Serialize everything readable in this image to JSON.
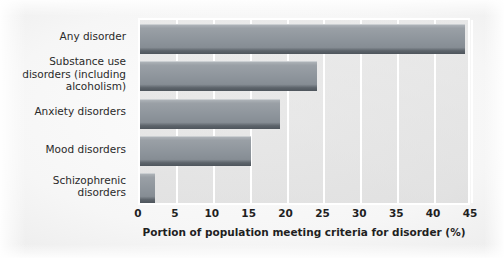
{
  "chart_data": {
    "type": "bar",
    "orientation": "horizontal",
    "title": "",
    "xlabel": "Portion of population meeting criteria for disorder (%)",
    "ylabel": "",
    "xlim": [
      0,
      45
    ],
    "ylim": null,
    "grid": true,
    "legend": null,
    "xticks": [
      "0",
      "5",
      "10",
      "15",
      "20",
      "25",
      "30",
      "35",
      "40",
      "45"
    ],
    "xtick_values": [
      0,
      5,
      10,
      15,
      20,
      25,
      30,
      35,
      40,
      45
    ],
    "categories": [
      "Any disorder",
      "Substance use disorders (including alcoholism)",
      "Anxiety disorders",
      "Mood disorders",
      "Schizophrenic disorders"
    ],
    "category_lines": [
      [
        "Any disorder"
      ],
      [
        "Substance use",
        "disorders (including",
        "alcoholism)"
      ],
      [
        "Anxiety disorders"
      ],
      [
        "Mood disorders"
      ],
      [
        "Schizophrenic",
        "disorders"
      ]
    ],
    "values": [
      44,
      24,
      19,
      15,
      2
    ],
    "bars": [
      {
        "label": "Any disorder",
        "value": 44
      },
      {
        "label": "Substance use disorders (including alcoholism)",
        "value": 24
      },
      {
        "label": "Anxiety disorders",
        "value": 19
      },
      {
        "label": "Mood disorders",
        "value": 15
      },
      {
        "label": "Schizophrenic disorders",
        "value": 2
      }
    ],
    "colors": {
      "bar_face": "#8d949b",
      "bar_highlight": "#b3b8bd",
      "bar_shadow": "#4e555c",
      "gridline": "#ffffff",
      "plot_border": "#ffffff",
      "plot_background": "#d8d8d8",
      "figure_background": "#f2f2f2",
      "text": "#1f1f1f"
    }
  }
}
